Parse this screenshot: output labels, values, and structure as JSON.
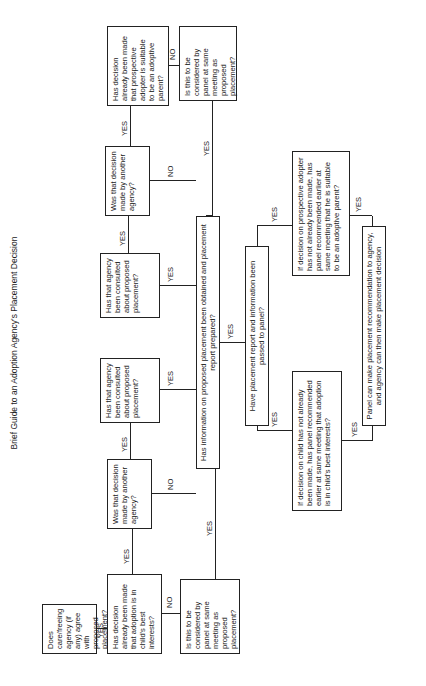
{
  "title": "Brief Guide to an Adoption Agency's Placement Decision",
  "nodes": {
    "care_agency": "Does care/freeing agency (if any) agree with proposed placement?",
    "child_decision": "Has decision already been made that adoption is in child's best interests?",
    "child_panel_same": "Is this to be considered by panel at same meeting as proposed placement?",
    "child_other_agency": "Was that decision made by another agency?",
    "child_consulted": "Has that agency been consulted about proposed placement?",
    "adopter_consulted": "Has that agency been consulted about proposed placement?",
    "adopter_other_agency": "Was that decision made by another agency?",
    "adopter_decision": "Has decision already been made that prospective adopter is suitable to be an adoptive parent?",
    "adopter_panel_same": "Is this to be considered by panel at same meeting as proposed placement?",
    "info_obtained": "Has information on proposed placement been obtained and placement report prepared?",
    "report_passed": "Have placement report and information been passed to panel?",
    "child_panel_recommend": "If decision on child has not already been made, has panel recommended earlier at same meeting that adoption is in child's best interests?",
    "adopter_panel_recommend": "If decision on prospective adopter has not already been made, has panel recommended earlier at same meeting that he is suitable to be an adoptive parent?",
    "final": "Panel can make placement recommendation to agency, and agency can then make placement decision"
  },
  "labels": {
    "yes": "YES",
    "no": "NO"
  }
}
